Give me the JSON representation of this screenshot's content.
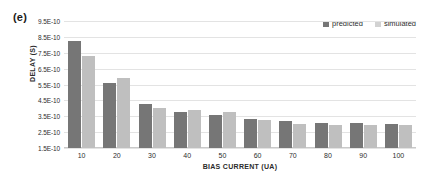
{
  "panel": {
    "label": "(e)"
  },
  "legend": {
    "position": "top-right",
    "entries": [
      {
        "label": "predicted",
        "color": "#767676"
      },
      {
        "label": "simulated",
        "color": "#d2d2d2"
      }
    ]
  },
  "axes": {
    "ylabel": "DELAY (S)",
    "xlabel": "BIAS CURRENT (UA)",
    "yticks": [
      "1.5E-10",
      "2.5E-10",
      "3.5E-10",
      "4.5E-10",
      "5.5E-10",
      "6.5E-10",
      "7.5E-10",
      "8.5E-10",
      "9.5E-10"
    ],
    "xticks": [
      "10",
      "20",
      "30",
      "40",
      "50",
      "60",
      "70",
      "80",
      "90",
      "100"
    ]
  },
  "chart_data": {
    "type": "bar",
    "title": "",
    "xlabel": "BIAS CURRENT (UA)",
    "ylabel": "DELAY (S)",
    "categories": [
      "10",
      "20",
      "30",
      "40",
      "50",
      "60",
      "70",
      "80",
      "90",
      "100"
    ],
    "series": [
      {
        "name": "predicted",
        "color": "#767676",
        "values": [
          8.25e-10,
          5.6e-10,
          4.3e-10,
          3.8e-10,
          3.55e-10,
          3.35e-10,
          3.2e-10,
          3.1e-10,
          3.05e-10,
          3e-10
        ]
      },
      {
        "name": "simulated",
        "color": "#bfbfbf",
        "values": [
          7.3e-10,
          5.9e-10,
          4.05e-10,
          3.9e-10,
          3.75e-10,
          3.25e-10,
          3e-10,
          2.95e-10,
          2.95e-10,
          2.95e-10
        ]
      }
    ],
    "ylim": [
      1.5e-10,
      9.5e-10
    ],
    "ytick_step": 1e-10,
    "grid": true,
    "legend_position": "top-right"
  }
}
